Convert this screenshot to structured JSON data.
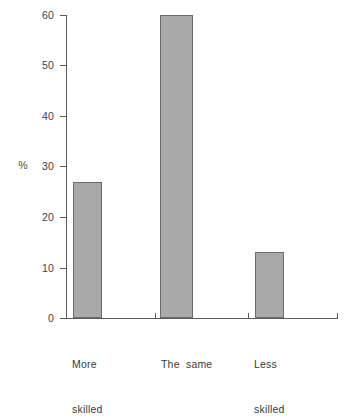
{
  "chart_data": {
    "type": "bar",
    "title": "",
    "subtitle": "",
    "xlabel": "",
    "ylabel": "%",
    "categories": [
      "More skilled",
      "The same",
      "Less skilled"
    ],
    "values": [
      27,
      60,
      13
    ],
    "ylim": [
      0,
      60
    ],
    "yticks": [
      0,
      10,
      20,
      30,
      40,
      50,
      60
    ],
    "ytick_labels": [
      "0",
      "10",
      "20",
      "30",
      "40",
      "50",
      "60"
    ],
    "grid": false,
    "legend": null,
    "annotations": [],
    "series": [
      {
        "name": "",
        "values": [
          27,
          60,
          13
        ]
      }
    ]
  },
  "axis": {
    "unit_label": "%",
    "tick_labels": {
      "t0": "0",
      "t10": "10",
      "t20": "20",
      "t30": "30",
      "t40": "40",
      "t50": "50",
      "t60": "60"
    }
  },
  "categories": {
    "more_skilled_line1": "More",
    "more_skilled_line2": "skilled",
    "the_same": "The  same",
    "less_skilled_line1": "Less",
    "less_skilled_line2": "skilled"
  },
  "colors": {
    "bar_fill": "#a9a9a9",
    "bar_border": "#6b6b6b",
    "axis": "#5a5a5a",
    "text": "#3a3a3a",
    "background": "#ffffff"
  }
}
